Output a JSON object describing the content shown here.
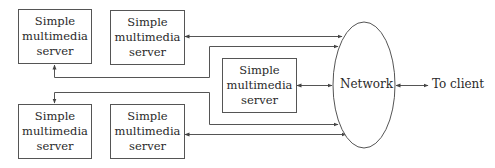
{
  "diagram": {
    "type": "architecture",
    "title": "",
    "servers": [
      {
        "id": "server-top-left",
        "lines": [
          "Simple",
          "multimedia",
          "server"
        ]
      },
      {
        "id": "server-top-middle",
        "lines": [
          "Simple",
          "multimedia",
          "server"
        ]
      },
      {
        "id": "server-center",
        "lines": [
          "Simple",
          "multimedia",
          "server"
        ]
      },
      {
        "id": "server-bottom-left",
        "lines": [
          "Simple",
          "multimedia",
          "server"
        ]
      },
      {
        "id": "server-bottom-middle",
        "lines": [
          "Simple",
          "multimedia",
          "server"
        ]
      }
    ],
    "network": {
      "label": "Network"
    },
    "client": {
      "label": "To client"
    },
    "connections": [
      {
        "from": "server-top-middle",
        "to": "network",
        "direction": "bidirectional"
      },
      {
        "from": "network",
        "to": "server-top-left",
        "direction": "bidirectional",
        "routing": "via x=209 and y=77"
      },
      {
        "from": "server-center",
        "to": "network",
        "direction": "bidirectional"
      },
      {
        "from": "network",
        "to": "server-bottom-left",
        "direction": "bidirectional",
        "routing": "via x=209 and y=92"
      },
      {
        "from": "server-bottom-middle",
        "to": "network",
        "direction": "bidirectional"
      },
      {
        "from": "network",
        "to": "client",
        "direction": "bidirectional"
      }
    ],
    "colors": {
      "stroke": "#555555",
      "text": "#2a2a2a",
      "background": "#ffffff"
    }
  }
}
